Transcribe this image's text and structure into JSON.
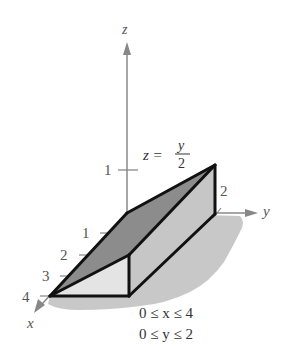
{
  "figure": {
    "type": "3d-solid-region",
    "axes": {
      "x": {
        "label": "x",
        "ticks": [
          "1",
          "2",
          "3",
          "4"
        ]
      },
      "y": {
        "label": "y",
        "ticks": [
          "2"
        ]
      },
      "z": {
        "label": "z",
        "ticks": [
          "1"
        ]
      }
    },
    "surface_equation": {
      "lhs": "z =",
      "numerator": "y",
      "denominator": "2"
    },
    "constraints": [
      "0 ≤ x ≤ 4",
      "0 ≤ y ≤ 2"
    ],
    "colors": {
      "axis": "#888888",
      "edge": "#111111",
      "top_face": "#8a8a8a",
      "side_face": "#c4c4c4",
      "front_face": "#e2e2e2",
      "shadow": "#bdbdbd"
    }
  }
}
